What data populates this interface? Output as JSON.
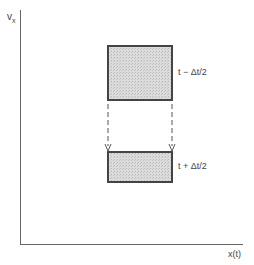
{
  "axes": {
    "y_label_main": "v",
    "y_label_sub": "x",
    "x_label": "x(t)"
  },
  "boxes": [
    {
      "label": "t − Δt/2",
      "x": 107,
      "y": 45,
      "w": 65,
      "h": 55
    },
    {
      "label": "t + Δt/2",
      "x": 107,
      "y": 152,
      "w": 65,
      "h": 30
    }
  ],
  "colors": {
    "axis": "#666666",
    "box_border": "#444444",
    "box_fill": "#d6d6d6",
    "arrow": "#555555"
  }
}
